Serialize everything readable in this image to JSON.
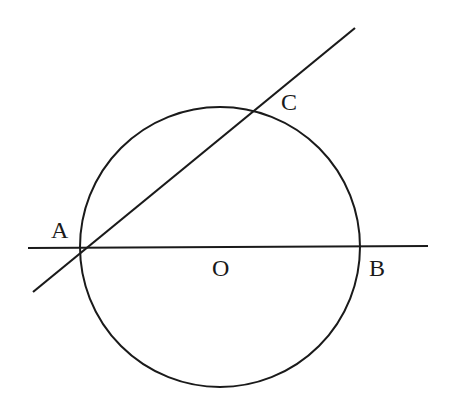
{
  "diagram": {
    "type": "geometry",
    "stroke_color": "#1a1a1a",
    "background": "#ffffff",
    "circle": {
      "center": "O",
      "cx": 220,
      "cy": 247,
      "r": 140
    },
    "lines": [
      {
        "name": "horizontal-line-AB",
        "x1": 28,
        "y1": 248,
        "x2": 428,
        "y2": 246
      },
      {
        "name": "secant-line-AC",
        "x1": 33,
        "y1": 292,
        "x2": 355,
        "y2": 28
      }
    ],
    "points": {
      "A": {
        "label": "A",
        "x": 84,
        "y": 248,
        "label_x": 51,
        "label_y": 238
      },
      "B": {
        "label": "B",
        "x": 357,
        "y": 246,
        "label_x": 369,
        "label_y": 276
      },
      "C": {
        "label": "C",
        "x": 256,
        "y": 110,
        "label_x": 281,
        "label_y": 110
      },
      "O": {
        "label": "O",
        "x": 220,
        "y": 247,
        "label_x": 212,
        "label_y": 276
      }
    }
  }
}
